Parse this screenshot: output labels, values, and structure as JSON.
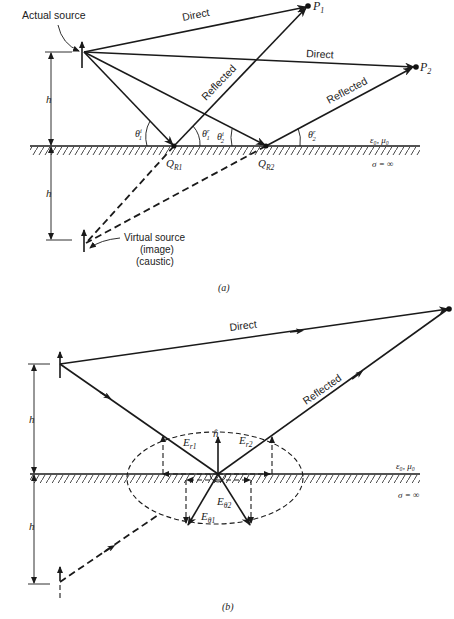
{
  "figure_a": {
    "caption": "(a)",
    "labels": {
      "actual_source": "Actual source",
      "direct_1": "Direct",
      "direct_2": "Direct",
      "reflected_1": "Reflected",
      "reflected_2": "Reflected",
      "p1": "P",
      "p1_sub": "1",
      "p2": "P",
      "p2_sub": "2",
      "h_upper": "h",
      "h_lower": "h",
      "theta1i": "θ",
      "theta1i_sup": "i",
      "theta1i_sub": "1",
      "theta1r": "θ",
      "theta1r_sup": "r",
      "theta1r_sub": "1",
      "theta2i": "θ",
      "theta2i_sup": "i",
      "theta2i_sub": "2",
      "theta2r": "θ",
      "theta2r_sup": "r",
      "theta2r_sub": "2",
      "qr1": "Q",
      "qr1_sub": "R1",
      "qr2": "Q",
      "qr2_sub": "R2",
      "medium": "ε₀, μ₀",
      "sigma": "σ = ∞",
      "virtual_source_1": "Virtual source",
      "virtual_source_2": "(image)",
      "virtual_source_3": "(caustic)"
    }
  },
  "figure_b": {
    "caption": "(b)",
    "labels": {
      "direct": "Direct",
      "reflected": "Reflected",
      "h_upper": "h",
      "h_lower": "h",
      "n_hat": "n̂",
      "er1": "E",
      "er1_sub": "r1",
      "er2": "E",
      "er2_sub": "r2",
      "etheta1": "E",
      "etheta1_sub": "θ1",
      "etheta2": "E",
      "etheta2_sub": "θ2",
      "medium": "ε₀, μ₀",
      "sigma": "σ = ∞"
    }
  }
}
